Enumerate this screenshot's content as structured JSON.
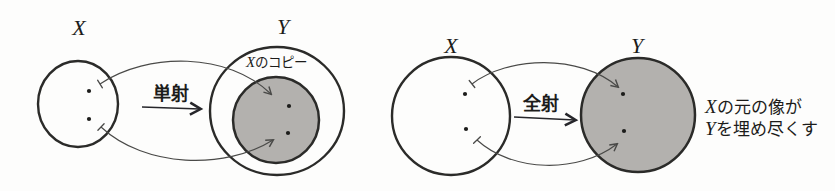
{
  "canvas": {
    "width": 835,
    "height": 191
  },
  "colors": {
    "background": "#fdfdfc",
    "outline": "#2b2b29",
    "set_fill_gray": "#b3b1ae",
    "curve_arrow": "#4a4a48",
    "text": "#1c1c1a"
  },
  "left": {
    "domain_label": "X",
    "codomain_label": "Y",
    "arrow_label": "単射",
    "copy_label_x": "X",
    "copy_label_suffix": "のコピー"
  },
  "right": {
    "domain_label": "X",
    "codomain_label": "Y",
    "arrow_label": "全射",
    "note_line1_x": "X",
    "note_line1_text": "の元の像が",
    "note_line2_y": "Y",
    "note_line2_text": "を埋め尽くす"
  }
}
